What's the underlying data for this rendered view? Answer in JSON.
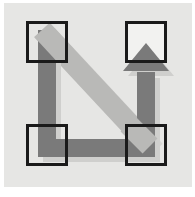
{
  "meta": {
    "canvas_width": 195,
    "canvas_height": 197
  },
  "colors": {
    "page_background": "#ffffff",
    "plate_background": "#e6e6e4",
    "node_outline": "#1a1a1a",
    "node_fill": "#f2f2f0",
    "path_dark": "#7a7a7a",
    "path_light": "#b9b9b7",
    "shadow": "#cfcfcd"
  },
  "plate": {
    "x": 4,
    "y": 3,
    "width": 188,
    "height": 184
  },
  "nodes": [
    {
      "name": "node-top-left",
      "label": "",
      "x": 26,
      "y": 21,
      "width": 42,
      "height": 42
    },
    {
      "name": "node-top-right",
      "label": "",
      "x": 125,
      "y": 21,
      "width": 42,
      "height": 42
    },
    {
      "name": "node-bottom-left",
      "label": "",
      "x": 26,
      "y": 124,
      "width": 42,
      "height": 42
    },
    {
      "name": "node-bottom-right",
      "label": "",
      "x": 125,
      "y": 124,
      "width": 42,
      "height": 42
    }
  ],
  "node_style": {
    "stroke_width": 3,
    "fill": "#f2f2f0",
    "stroke": "#1a1a1a"
  },
  "paths": {
    "main_route": {
      "name": "routed-path-with-arrow",
      "color": "#7a7a7a",
      "stroke_width": 18,
      "waypoints": [
        {
          "x": 47,
          "y": 34
        },
        {
          "x": 47,
          "y": 148
        },
        {
          "x": 146,
          "y": 148
        },
        {
          "x": 146,
          "y": 62
        }
      ],
      "arrow_at": "end",
      "arrow_direction": "up",
      "arrow_width": 46,
      "arrow_height": 28
    },
    "diagonal_band": {
      "name": "diagonal-link",
      "color": "#b9b9b7",
      "stroke_width": 21,
      "from": {
        "x": 42,
        "y": 30
      },
      "to": {
        "x": 150,
        "y": 146
      }
    },
    "drop_shadow": {
      "name": "path-shadow",
      "color": "#cfcfcd",
      "offset_x": 5,
      "offset_y": 5
    }
  },
  "annotations": {
    "description": "Four square nodes connected by a thick gray route travelling down the left side, across the bottom, then up to the top-right node where it ends in an upward arrowhead; a lighter gray diagonal band crosses from the top-left node to the bottom-right node.",
    "arrow_label": "",
    "caption": ""
  }
}
